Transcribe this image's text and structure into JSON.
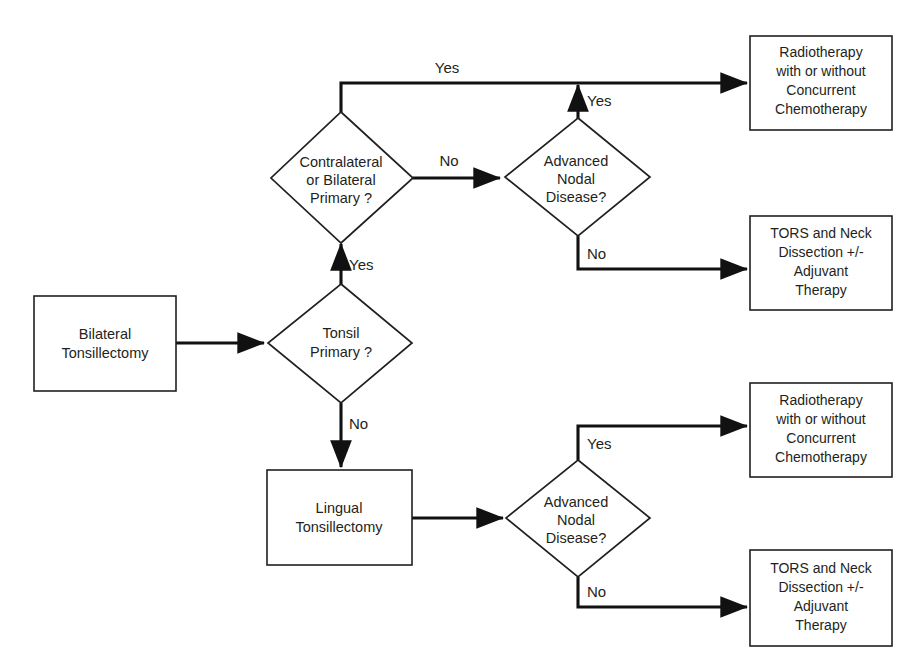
{
  "diagram": {
    "type": "flowchart",
    "title": "",
    "background_color": "#ffffff",
    "line_color": "#111111",
    "text_color": "#231f20",
    "nodes": [
      {
        "id": "bilateral-tonsillectomy",
        "shape": "rectangle",
        "lines": [
          "Bilateral",
          "Tonsillectomy"
        ]
      },
      {
        "id": "tonsil-primary",
        "shape": "diamond",
        "lines": [
          "Tonsil",
          "Primary ?"
        ]
      },
      {
        "id": "contralateral-bilateral-primary",
        "shape": "diamond",
        "lines": [
          "Contralateral",
          "or Bilateral",
          "Primary ?"
        ]
      },
      {
        "id": "advanced-nodal-disease-top",
        "shape": "diamond",
        "lines": [
          "Advanced",
          "Nodal",
          "Disease?"
        ]
      },
      {
        "id": "lingual-tonsillectomy",
        "shape": "rectangle",
        "lines": [
          "Lingual",
          "Tonsillectomy"
        ]
      },
      {
        "id": "advanced-nodal-disease-bottom",
        "shape": "diamond",
        "lines": [
          "Advanced",
          "Nodal",
          "Disease?"
        ]
      },
      {
        "id": "radiotherapy-top",
        "shape": "rectangle",
        "lines": [
          "Radiotherapy",
          "with or without",
          "Concurrent",
          "Chemotherapy"
        ]
      },
      {
        "id": "tors-neck-dissection-top",
        "shape": "rectangle",
        "lines": [
          "TORS  and Neck",
          "Dissection +/-",
          "Adjuvant",
          "Therapy"
        ]
      },
      {
        "id": "radiotherapy-bottom",
        "shape": "rectangle",
        "lines": [
          "Radiotherapy",
          "with or without",
          "Concurrent",
          "Chemotherapy"
        ]
      },
      {
        "id": "tors-neck-dissection-bottom",
        "shape": "rectangle",
        "lines": [
          "TORS and Neck",
          "Dissection +/-",
          "Adjuvant",
          "Therapy"
        ]
      }
    ],
    "edges": [
      {
        "id": "bilateral-to-tonsil",
        "label": ""
      },
      {
        "id": "tonsil-primary-yes",
        "label": "Yes"
      },
      {
        "id": "tonsil-primary-no",
        "label": "No"
      },
      {
        "id": "contralateral-yes",
        "label": "Yes"
      },
      {
        "id": "contralateral-no",
        "label": "No"
      },
      {
        "id": "nodal-top-yes",
        "label": "Yes"
      },
      {
        "id": "nodal-top-no",
        "label": "No"
      },
      {
        "id": "lingual-to-nodal",
        "label": ""
      },
      {
        "id": "nodal-bottom-yes",
        "label": "Yes"
      },
      {
        "id": "nodal-bottom-no",
        "label": "No"
      }
    ]
  },
  "labels": {
    "n0_l0": "Bilateral",
    "n0_l1": "Tonsillectomy",
    "n1_l0": "Tonsil",
    "n1_l1": "Primary ?",
    "n2_l0": "Contralateral",
    "n2_l1": "or Bilateral",
    "n2_l2": "Primary ?",
    "n3_l0": "Advanced",
    "n3_l1": "Nodal",
    "n3_l2": "Disease?",
    "n4_l0": "Lingual",
    "n4_l1": "Tonsillectomy",
    "n5_l0": "Advanced",
    "n5_l1": "Nodal",
    "n5_l2": "Disease?",
    "n6_l0": "Radiotherapy",
    "n6_l1": "with or without",
    "n6_l2": "Concurrent",
    "n6_l3": "Chemotherapy",
    "n7_l0": "TORS  and Neck",
    "n7_l1": "Dissection +/-",
    "n7_l2": "Adjuvant",
    "n7_l3": "Therapy",
    "n8_l0": "Radiotherapy",
    "n8_l1": "with or without",
    "n8_l2": "Concurrent",
    "n8_l3": "Chemotherapy",
    "n9_l0": "TORS and Neck",
    "n9_l1": "Dissection +/-",
    "n9_l2": "Adjuvant",
    "n9_l3": "Therapy",
    "e_contra_yes": "Yes",
    "e_contra_no": "No",
    "e_nodal_top_yes": "Yes",
    "e_nodal_top_no": "No",
    "e_tonsil_yes": "Yes",
    "e_tonsil_no": "No",
    "e_nodal_bot_yes": "Yes",
    "e_nodal_bot_no": "No"
  }
}
